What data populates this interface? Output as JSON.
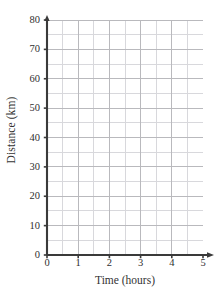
{
  "chart_data": {
    "type": "line",
    "title": "",
    "subtitle": "",
    "xlabel": "Time (hours)",
    "ylabel": "Distance (km)",
    "xlim": [
      0,
      5
    ],
    "ylim": [
      0,
      80
    ],
    "x_tick_labels": [
      "0",
      "1",
      "2",
      "3",
      "4",
      "5"
    ],
    "x_tick_values": [
      0,
      1,
      2,
      3,
      4,
      5
    ],
    "y_tick_labels": [
      "0",
      "10",
      "20",
      "30",
      "40",
      "50",
      "60",
      "70",
      "80"
    ],
    "y_tick_values": [
      0,
      10,
      20,
      30,
      40,
      50,
      60,
      70,
      80
    ],
    "x_minor_step": 0.5,
    "y_minor_step": 5,
    "grid": true,
    "grid_color": "#b9b9bd",
    "minor_grid_color": "#d8d8dc",
    "axis_color": "#3a3a3a",
    "legend": [],
    "legend_position": "none",
    "annotations": [],
    "series": [],
    "values": [],
    "categories": [],
    "note": "Empty grid: no data plotted"
  },
  "axes": {
    "y_title": "Distance (km)",
    "x_title": "Time (hours)",
    "x_arrow": "arrow-right",
    "y_arrow": "arrow-up"
  }
}
